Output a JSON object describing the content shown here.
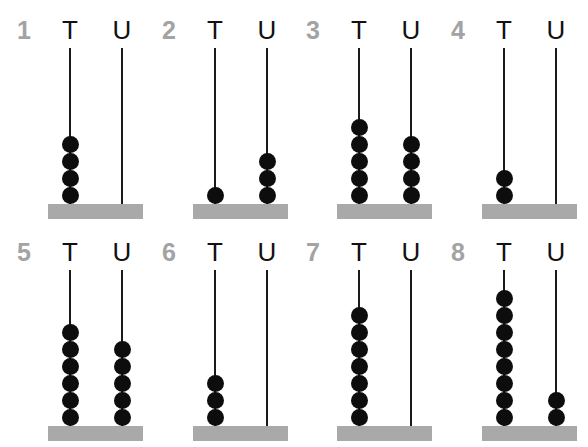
{
  "column_labels": {
    "tens": "T",
    "units": "U"
  },
  "abacuses": [
    {
      "number": "1",
      "tens": 4,
      "units": 0
    },
    {
      "number": "2",
      "tens": 1,
      "units": 3
    },
    {
      "number": "3",
      "tens": 5,
      "units": 4
    },
    {
      "number": "4",
      "tens": 2,
      "units": 0
    },
    {
      "number": "5",
      "tens": 6,
      "units": 5
    },
    {
      "number": "6",
      "tens": 3,
      "units": 0
    },
    {
      "number": "7",
      "tens": 7,
      "units": 0
    },
    {
      "number": "8",
      "tens": 8,
      "units": 2
    }
  ],
  "colors": {
    "number": "#a3a3a3",
    "label": "#111111",
    "rod": "#1a1a1a",
    "bead": "#0d0d0d",
    "base": "#a9a9a9"
  }
}
